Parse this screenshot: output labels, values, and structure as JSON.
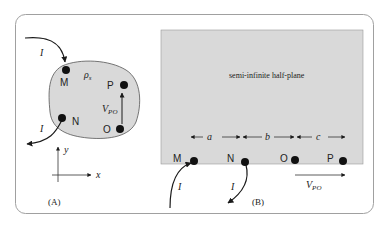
{
  "panelA": {
    "caption": "(A)",
    "region_label": "ρ",
    "region_label_sub": "s",
    "nodes": [
      "M",
      "N",
      "O",
      "P"
    ],
    "current_in_label": "I",
    "current_out_label": "I",
    "voltage_label": "V",
    "voltage_sub": "PO",
    "axis_x": "x",
    "axis_y": "y"
  },
  "panelB": {
    "caption": "(B)",
    "region_label": "semi-infinite half-plane",
    "nodes": [
      "M",
      "N",
      "O",
      "P"
    ],
    "spacings": [
      "a",
      "b",
      "c"
    ],
    "current_in_label": "I",
    "current_out_label": "I",
    "voltage_label": "V",
    "voltage_sub": "PO"
  },
  "colors": {
    "region_fill": "#d9d9d9",
    "frame": "#9a9a9a",
    "ink": "#1a1a1a"
  }
}
